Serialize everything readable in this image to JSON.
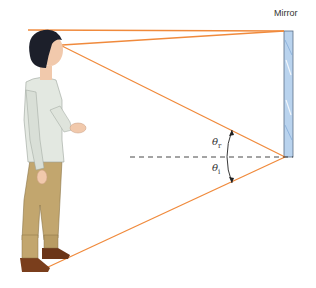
{
  "diagram": {
    "title_label": "Mirror",
    "angles": {
      "reflection_symbol": "θ",
      "reflection_sub": "r",
      "incidence_symbol": "θ",
      "incidence_sub": "i"
    },
    "colors": {
      "ray": "#f08a3c",
      "mirror_fill": "#b9d3ee",
      "mirror_edge": "#5a6e86",
      "dashed_normal": "#333333",
      "shirt": "#e3e8e1",
      "pants": "#c2a66e",
      "shoes": "#7a3e1c",
      "hair": "#1c1f2a",
      "skin": "#f1c9ac"
    },
    "elements": [
      "person-standing",
      "vertical-mirror",
      "ray-top-of-head",
      "ray-eye-to-mirror-top",
      "ray-eye-to-mirror-bottom",
      "ray-feet-to-mirror-bottom",
      "normal-dashed-line",
      "angle-arc"
    ]
  }
}
